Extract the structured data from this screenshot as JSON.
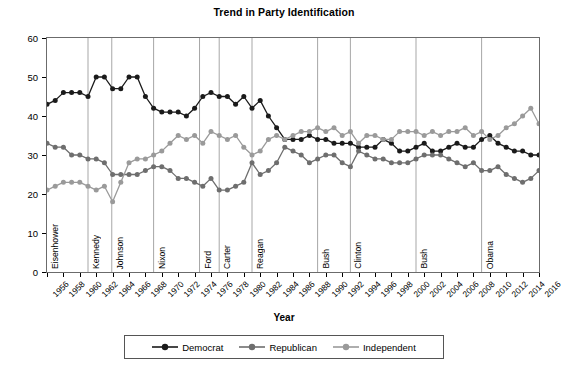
{
  "chart_data": {
    "type": "line",
    "title": "Trend in Party Identification",
    "xlabel": "Year",
    "ylabel": "",
    "ylim": [
      0,
      60
    ],
    "ytick_step": 10,
    "yticks": [
      0,
      10,
      20,
      30,
      40,
      50,
      60
    ],
    "xlim": [
      1956,
      2016
    ],
    "grid": "vertical-only",
    "legend_position": "bottom",
    "x": [
      1956,
      1958,
      1960,
      1962,
      1964,
      1966,
      1968,
      1970,
      1972,
      1974,
      1976,
      1978,
      1980,
      1982,
      1984,
      1986,
      1988,
      1990,
      1992,
      1994,
      1996,
      1998,
      2000,
      2002,
      2004,
      2006,
      2008,
      2010,
      2012,
      2014,
      2016
    ],
    "categories": [
      "1956",
      "1958",
      "1960",
      "1962",
      "1964",
      "1966",
      "1968",
      "1970",
      "1972",
      "1974",
      "1976",
      "1978",
      "1980",
      "1982",
      "1984",
      "1986",
      "1988",
      "1990",
      "1992",
      "1994",
      "1996",
      "1998",
      "2000",
      "2002",
      "2004",
      "2006",
      "2008",
      "2010",
      "2012",
      "2014",
      "2016"
    ],
    "series": [
      {
        "name": "Democrat",
        "color": "#1a1a1a",
        "x": [
          1956,
          1957,
          1958,
          1959,
          1960,
          1961,
          1962,
          1963,
          1964,
          1965,
          1966,
          1967,
          1968,
          1969,
          1970,
          1971,
          1972,
          1973,
          1974,
          1975,
          1976,
          1977,
          1978,
          1979,
          1980,
          1981,
          1982,
          1983,
          1984,
          1985,
          1986,
          1987,
          1988,
          1989,
          1990,
          1991,
          1992,
          1993,
          1994,
          1995,
          1996,
          1997,
          1998,
          1999,
          2000,
          2001,
          2002,
          2003,
          2004,
          2005,
          2006,
          2007,
          2008,
          2009,
          2010,
          2011,
          2012,
          2013,
          2014,
          2015,
          2016
        ],
        "values": [
          43,
          44,
          46,
          46,
          46,
          45,
          50,
          50,
          47,
          47,
          50,
          50,
          45,
          42,
          41,
          41,
          41,
          40,
          42,
          45,
          46,
          45,
          45,
          43,
          45,
          42,
          44,
          40,
          37,
          34,
          34,
          34,
          35,
          34,
          34,
          33,
          33,
          33,
          32,
          32,
          32,
          34,
          33,
          31,
          31,
          32,
          33,
          31,
          31,
          32,
          33,
          32,
          32,
          34,
          35,
          33,
          32,
          31,
          31,
          30,
          30
        ]
      },
      {
        "name": "Republican",
        "color": "#6e6e6e",
        "x": [
          1956,
          1957,
          1958,
          1959,
          1960,
          1961,
          1962,
          1963,
          1964,
          1965,
          1966,
          1967,
          1968,
          1969,
          1970,
          1971,
          1972,
          1973,
          1974,
          1975,
          1976,
          1977,
          1978,
          1979,
          1980,
          1981,
          1982,
          1983,
          1984,
          1985,
          1986,
          1987,
          1988,
          1989,
          1990,
          1991,
          1992,
          1993,
          1994,
          1995,
          1996,
          1997,
          1998,
          1999,
          2000,
          2001,
          2002,
          2003,
          2004,
          2005,
          2006,
          2007,
          2008,
          2009,
          2010,
          2011,
          2012,
          2013,
          2014,
          2015,
          2016
        ],
        "values": [
          33,
          32,
          32,
          30,
          30,
          29,
          29,
          28,
          25,
          25,
          25,
          25,
          26,
          27,
          27,
          26,
          24,
          24,
          23,
          22,
          24,
          21,
          21,
          22,
          23,
          28,
          25,
          26,
          28,
          32,
          31,
          30,
          28,
          29,
          30,
          30,
          28,
          27,
          31,
          30,
          29,
          29,
          28,
          28,
          28,
          29,
          30,
          30,
          30,
          29,
          28,
          27,
          28,
          26,
          26,
          27,
          25,
          24,
          23,
          24,
          26
        ]
      },
      {
        "name": "Independent",
        "color": "#9a9a9a",
        "x": [
          1956,
          1957,
          1958,
          1959,
          1960,
          1961,
          1962,
          1963,
          1964,
          1965,
          1966,
          1967,
          1968,
          1969,
          1970,
          1971,
          1972,
          1973,
          1974,
          1975,
          1976,
          1977,
          1978,
          1979,
          1980,
          1981,
          1982,
          1983,
          1984,
          1985,
          1986,
          1987,
          1988,
          1989,
          1990,
          1991,
          1992,
          1993,
          1994,
          1995,
          1996,
          1997,
          1998,
          1999,
          2000,
          2001,
          2002,
          2003,
          2004,
          2005,
          2006,
          2007,
          2008,
          2009,
          2010,
          2011,
          2012,
          2013,
          2014,
          2015,
          2016
        ],
        "values": [
          21,
          22,
          23,
          23,
          23,
          22,
          21,
          22,
          18,
          23,
          28,
          29,
          29,
          30,
          31,
          33,
          35,
          34,
          35,
          33,
          36,
          35,
          34,
          35,
          32,
          30,
          31,
          34,
          35,
          34,
          35,
          36,
          36,
          37,
          36,
          37,
          35,
          36,
          33,
          35,
          35,
          34,
          34,
          36,
          36,
          36,
          35,
          36,
          35,
          36,
          36,
          37,
          35,
          36,
          34,
          35,
          37,
          38,
          40,
          42,
          38
        ]
      }
    ],
    "presidents": [
      {
        "name": "Eisenhower",
        "start": 1956,
        "end": 1961
      },
      {
        "name": "Kennedy",
        "start": 1961,
        "end": 1963.9
      },
      {
        "name": "Johnson",
        "start": 1963.9,
        "end": 1969
      },
      {
        "name": "Nixon",
        "start": 1969,
        "end": 1974.6
      },
      {
        "name": "Ford",
        "start": 1974.6,
        "end": 1977
      },
      {
        "name": "Carter",
        "start": 1977,
        "end": 1981
      },
      {
        "name": "Reagan",
        "start": 1981,
        "end": 1989
      },
      {
        "name": "Bush",
        "start": 1989,
        "end": 1993
      },
      {
        "name": "Clinton",
        "start": 1993,
        "end": 2001
      },
      {
        "name": "Bush",
        "start": 2001,
        "end": 2009
      },
      {
        "name": "Obama",
        "start": 2009,
        "end": 2016
      }
    ]
  },
  "legend": {
    "items": [
      {
        "label": "Democrat"
      },
      {
        "label": "Republican"
      },
      {
        "label": "Independent"
      }
    ]
  }
}
